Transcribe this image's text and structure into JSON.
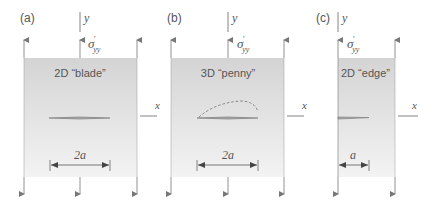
{
  "figure": {
    "panels": [
      {
        "id": "a",
        "label": "(a)",
        "title": "2D “blade”",
        "dimension": "2a",
        "axis_y": "y",
        "axis_x": "x",
        "stress": "σ",
        "stress_sup": "′",
        "stress_sub": "yy"
      },
      {
        "id": "b",
        "label": "(b)",
        "title": "3D “penny”",
        "dimension": "2a",
        "axis_y": "y",
        "axis_x": "x",
        "stress": "σ",
        "stress_sup": "′",
        "stress_sub": "yy"
      },
      {
        "id": "c",
        "label": "(c)",
        "title": "2D “edge”",
        "dimension": "a",
        "axis_y": "y",
        "axis_x": "x",
        "stress": "σ",
        "stress_sup": "′",
        "stress_sub": "yy"
      }
    ],
    "colors": {
      "box_fill_top": "#d6d6d6",
      "box_fill_bottom": "#f2f2f2",
      "line": "#777777",
      "crack": "#888888",
      "text": "#555555"
    }
  }
}
